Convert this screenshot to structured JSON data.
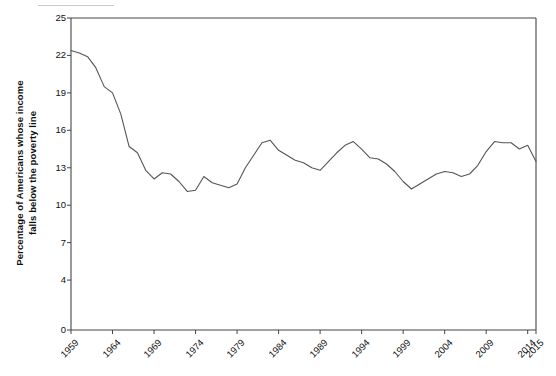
{
  "chart_data": {
    "type": "line",
    "title": "",
    "xlabel": "",
    "ylabel": "Percentage of Americans whose income falls below the poverty line",
    "ylabel_line1": "Percentage of Americans whose income",
    "ylabel_line2": "falls below the poverty line",
    "xlim": [
      1959,
      2015
    ],
    "ylim": [
      0,
      25
    ],
    "ytick_labels": [
      "25",
      "22",
      "19",
      "16",
      "13",
      "10",
      "7",
      "4",
      "0"
    ],
    "yticks": [
      25,
      22,
      19,
      16,
      13,
      10,
      7,
      4,
      0
    ],
    "xtick_labels": [
      "1959",
      "1964",
      "1969",
      "1974",
      "1979",
      "1984",
      "1989",
      "1994",
      "1999",
      "2004",
      "2009",
      "2014",
      "2015"
    ],
    "xticks": [
      1959,
      1964,
      1969,
      1974,
      1979,
      1984,
      1989,
      1994,
      1999,
      2004,
      2009,
      2014,
      2015
    ],
    "grid": false,
    "legend": false,
    "line_color": "#555555",
    "axis_color": "#444444",
    "series": [
      {
        "name": "Poverty rate",
        "x": [
          1959,
          1960,
          1961,
          1962,
          1963,
          1964,
          1965,
          1966,
          1967,
          1968,
          1969,
          1970,
          1971,
          1972,
          1973,
          1974,
          1975,
          1976,
          1977,
          1978,
          1979,
          1980,
          1981,
          1982,
          1983,
          1984,
          1985,
          1986,
          1987,
          1988,
          1989,
          1990,
          1991,
          1992,
          1993,
          1994,
          1995,
          1996,
          1997,
          1998,
          1999,
          2000,
          2001,
          2002,
          2003,
          2004,
          2005,
          2006,
          2007,
          2008,
          2009,
          2010,
          2011,
          2012,
          2013,
          2014,
          2015
        ],
        "values": [
          22.4,
          22.2,
          21.9,
          21.0,
          19.5,
          19.0,
          17.3,
          14.7,
          14.2,
          12.8,
          12.1,
          12.6,
          12.5,
          11.9,
          11.1,
          11.2,
          12.3,
          11.8,
          11.6,
          11.4,
          11.7,
          13.0,
          14.0,
          15.0,
          15.2,
          14.4,
          14.0,
          13.6,
          13.4,
          13.0,
          12.8,
          13.5,
          14.2,
          14.8,
          15.1,
          14.5,
          13.8,
          13.7,
          13.3,
          12.7,
          11.9,
          11.3,
          11.7,
          12.1,
          12.5,
          12.7,
          12.6,
          12.3,
          12.5,
          13.2,
          14.3,
          15.1,
          15.0,
          15.0,
          14.5,
          14.8,
          13.5
        ]
      }
    ]
  },
  "decoration": {
    "top_rule_label": ""
  }
}
